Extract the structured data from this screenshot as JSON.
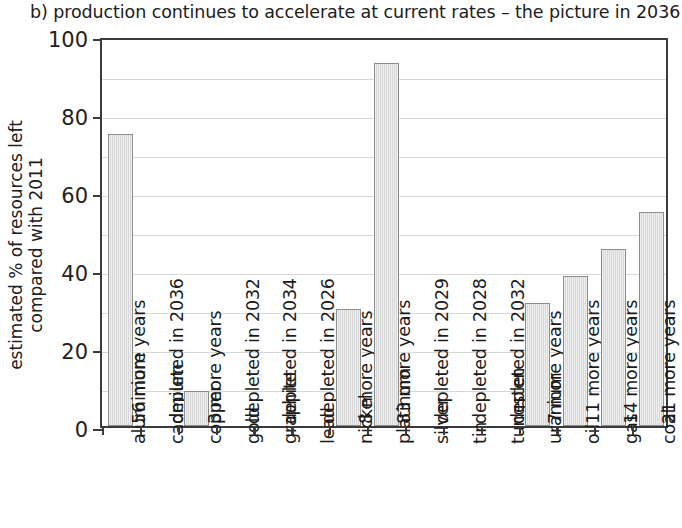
{
  "caption": "b) production continues to accelerate at current rates – the picture in 2036",
  "chart_data": {
    "type": "bar",
    "title": "b) production continues to accelerate at current rates – the picture in 2036",
    "xlabel": "",
    "ylabel": "estimated % of resources left compared with 2011",
    "ylabel_line1": "estimated % of resources left",
    "ylabel_line2": "compared with 2011",
    "ylim": [
      0,
      100
    ],
    "yticks": [
      0,
      20,
      40,
      60,
      80,
      100
    ],
    "ytick_labels": [
      "0",
      "20",
      "40",
      "60",
      "80",
      "100"
    ],
    "grid": true,
    "grid_step": 10,
    "legend": "none",
    "bar_fill": "#dcdcdc",
    "bar_edge": "#8d8d8d",
    "axis_color": "#3b3b3b",
    "categories": [
      "aluminium",
      "cadmium",
      "copper",
      "gold",
      "graphite",
      "lead",
      "nickel",
      "platinum",
      "silver",
      "tin",
      "tungsten",
      "uranium",
      "oil",
      "gas",
      "coal"
    ],
    "values": [
      75,
      0,
      9,
      0,
      0,
      0,
      30,
      93,
      0,
      0,
      0,
      31.5,
      38.5,
      45.5,
      55
    ],
    "annotations": [
      "56 more years",
      "depleted in 2036",
      "3 more years",
      "depleted in 2032",
      "depleted in 2034",
      "depleted in 2026",
      "8 more years",
      "83 more years",
      "depleted in 2029",
      "depleted in 2028",
      "depleted in 2032",
      "7 more years",
      "11 more years",
      "14 more years",
      "21 more years"
    ]
  }
}
